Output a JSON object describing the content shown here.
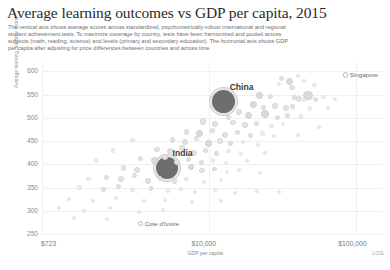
{
  "header": {
    "title": "Average learning outcomes vs GDP per capita, 2015",
    "subtitle_lines": [
      "The vertical axis shows average scores across standardized, psychometrically-robust international and regional",
      "student achievement tests. To maximize coverage by country, tests have been harmonized and pooled across",
      "subjects (math, reading, science) and levels (primary and secondary education). The horizontal axis shows GDP",
      "per capita after adjusting for price differences between countries and across time."
    ]
  },
  "chart_data": {
    "type": "scatter",
    "title": "Average learning outcomes vs GDP per capita, 2015",
    "xlabel": "GDP per capita",
    "ylabel": "Average learning outcome score",
    "xscale": "LOG",
    "xscale_note": "LOG",
    "xlim": [
      723,
      150000
    ],
    "ylim": [
      250,
      620
    ],
    "grid": true,
    "legend": "none",
    "yticks": [
      600,
      550,
      500,
      450,
      400,
      350,
      300,
      250
    ],
    "xticks": [
      "$723",
      "$10,000",
      "$100,000"
    ],
    "xtick_values": [
      723,
      10000,
      100000
    ],
    "annotations": [
      {
        "label": "China",
        "x": 12500,
        "y": 535,
        "size": "large"
      },
      {
        "label": "India",
        "x": 5100,
        "y": 392,
        "size": "large"
      },
      {
        "label": "Singapore",
        "x": 85000,
        "y": 592,
        "size": "small"
      },
      {
        "label": "Cote d'Ivoire",
        "x": 3400,
        "y": 272,
        "size": "small"
      }
    ],
    "points": [
      {
        "x": 12500,
        "y": 535,
        "r": 13.5,
        "cls": "big",
        "name": "China"
      },
      {
        "x": 5100,
        "y": 392,
        "r": 13.0,
        "cls": "big",
        "name": "India"
      },
      {
        "x": 85000,
        "y": 592,
        "r": 2.6,
        "cls": "ring",
        "name": "Singapore"
      },
      {
        "x": 3400,
        "y": 272,
        "r": 2.6,
        "cls": "ring",
        "name": "Cote d'Ivoire"
      },
      {
        "x": 31000,
        "y": 585,
        "r": 2.4,
        "cls": "pt"
      },
      {
        "x": 35000,
        "y": 578,
        "r": 3.6,
        "cls": "mid"
      },
      {
        "x": 40000,
        "y": 590,
        "r": 2.2,
        "cls": "tiny"
      },
      {
        "x": 44000,
        "y": 580,
        "r": 2.0,
        "cls": "tiny"
      },
      {
        "x": 36500,
        "y": 566,
        "r": 2.6,
        "cls": "pt"
      },
      {
        "x": 30000,
        "y": 572,
        "r": 2.0,
        "cls": "tiny"
      },
      {
        "x": 52000,
        "y": 570,
        "r": 2.1,
        "cls": "tiny"
      },
      {
        "x": 22000,
        "y": 548,
        "r": 3.2,
        "cls": "mid"
      },
      {
        "x": 26000,
        "y": 545,
        "r": 2.4,
        "cls": "pt"
      },
      {
        "x": 47000,
        "y": 548,
        "r": 4.6,
        "cls": "mid"
      },
      {
        "x": 53000,
        "y": 540,
        "r": 2.6,
        "cls": "pt"
      },
      {
        "x": 60000,
        "y": 545,
        "r": 2.2,
        "cls": "tiny"
      },
      {
        "x": 41000,
        "y": 540,
        "r": 3.0,
        "cls": "pt"
      },
      {
        "x": 38000,
        "y": 543,
        "r": 2.6,
        "cls": "pt"
      },
      {
        "x": 44000,
        "y": 538,
        "r": 2.2,
        "cls": "tiny"
      },
      {
        "x": 72000,
        "y": 540,
        "r": 2.0,
        "cls": "tiny"
      },
      {
        "x": 20000,
        "y": 528,
        "r": 3.4,
        "cls": "mid"
      },
      {
        "x": 23500,
        "y": 522,
        "r": 2.4,
        "cls": "pt"
      },
      {
        "x": 28000,
        "y": 525,
        "r": 2.8,
        "cls": "pt"
      },
      {
        "x": 33000,
        "y": 520,
        "r": 3.0,
        "cls": "pt"
      },
      {
        "x": 37000,
        "y": 524,
        "r": 2.4,
        "cls": "pt"
      },
      {
        "x": 48000,
        "y": 520,
        "r": 2.2,
        "cls": "tiny"
      },
      {
        "x": 64000,
        "y": 522,
        "r": 2.0,
        "cls": "tiny"
      },
      {
        "x": 16000,
        "y": 512,
        "r": 3.0,
        "cls": "pt"
      },
      {
        "x": 18500,
        "y": 505,
        "r": 3.4,
        "cls": "mid"
      },
      {
        "x": 24000,
        "y": 508,
        "r": 4.0,
        "cls": "mid"
      },
      {
        "x": 29000,
        "y": 500,
        "r": 2.6,
        "cls": "pt"
      },
      {
        "x": 34000,
        "y": 505,
        "r": 2.4,
        "cls": "pt"
      },
      {
        "x": 42000,
        "y": 503,
        "r": 2.2,
        "cls": "tiny"
      },
      {
        "x": 13500,
        "y": 500,
        "r": 2.4,
        "cls": "pt"
      },
      {
        "x": 9000,
        "y": 492,
        "r": 3.2,
        "cls": "pt"
      },
      {
        "x": 11000,
        "y": 487,
        "r": 3.0,
        "cls": "pt"
      },
      {
        "x": 14500,
        "y": 490,
        "r": 2.6,
        "cls": "pt"
      },
      {
        "x": 17500,
        "y": 484,
        "r": 2.8,
        "cls": "pt"
      },
      {
        "x": 21000,
        "y": 488,
        "r": 2.4,
        "cls": "pt"
      },
      {
        "x": 26500,
        "y": 482,
        "r": 2.2,
        "cls": "tiny"
      },
      {
        "x": 31500,
        "y": 486,
        "r": 2.0,
        "cls": "tiny"
      },
      {
        "x": 56000,
        "y": 480,
        "r": 2.0,
        "cls": "tiny"
      },
      {
        "x": 7000,
        "y": 470,
        "r": 2.8,
        "cls": "pt"
      },
      {
        "x": 8600,
        "y": 466,
        "r": 3.4,
        "cls": "mid"
      },
      {
        "x": 10500,
        "y": 472,
        "r": 2.6,
        "cls": "pt"
      },
      {
        "x": 12800,
        "y": 464,
        "r": 3.0,
        "cls": "pt"
      },
      {
        "x": 15500,
        "y": 468,
        "r": 2.4,
        "cls": "pt"
      },
      {
        "x": 19000,
        "y": 462,
        "r": 2.8,
        "cls": "pt"
      },
      {
        "x": 23000,
        "y": 466,
        "r": 2.2,
        "cls": "tiny"
      },
      {
        "x": 27500,
        "y": 460,
        "r": 2.0,
        "cls": "tiny"
      },
      {
        "x": 40000,
        "y": 463,
        "r": 2.0,
        "cls": "tiny"
      },
      {
        "x": 5600,
        "y": 452,
        "r": 2.6,
        "cls": "pt"
      },
      {
        "x": 6800,
        "y": 448,
        "r": 3.0,
        "cls": "pt"
      },
      {
        "x": 8200,
        "y": 455,
        "r": 2.4,
        "cls": "pt"
      },
      {
        "x": 9800,
        "y": 445,
        "r": 3.6,
        "cls": "mid"
      },
      {
        "x": 11800,
        "y": 450,
        "r": 2.8,
        "cls": "pt"
      },
      {
        "x": 14000,
        "y": 444,
        "r": 2.4,
        "cls": "pt"
      },
      {
        "x": 17000,
        "y": 448,
        "r": 2.2,
        "cls": "tiny"
      },
      {
        "x": 21500,
        "y": 442,
        "r": 2.0,
        "cls": "tiny"
      },
      {
        "x": 3000,
        "y": 452,
        "r": 2.2,
        "cls": "tiny"
      },
      {
        "x": 4400,
        "y": 432,
        "r": 2.8,
        "cls": "pt"
      },
      {
        "x": 5400,
        "y": 428,
        "r": 3.2,
        "cls": "pt"
      },
      {
        "x": 6500,
        "y": 435,
        "r": 2.6,
        "cls": "pt"
      },
      {
        "x": 7800,
        "y": 425,
        "r": 3.0,
        "cls": "pt"
      },
      {
        "x": 9400,
        "y": 430,
        "r": 2.4,
        "cls": "pt"
      },
      {
        "x": 11200,
        "y": 424,
        "r": 2.6,
        "cls": "pt"
      },
      {
        "x": 13500,
        "y": 428,
        "r": 2.2,
        "cls": "tiny"
      },
      {
        "x": 16500,
        "y": 422,
        "r": 2.0,
        "cls": "tiny"
      },
      {
        "x": 24000,
        "y": 425,
        "r": 2.0,
        "cls": "tiny"
      },
      {
        "x": 2200,
        "y": 430,
        "r": 2.2,
        "cls": "tiny"
      },
      {
        "x": 3400,
        "y": 412,
        "r": 2.6,
        "cls": "pt"
      },
      {
        "x": 4200,
        "y": 408,
        "r": 3.4,
        "cls": "mid"
      },
      {
        "x": 5000,
        "y": 415,
        "r": 2.8,
        "cls": "pt"
      },
      {
        "x": 6000,
        "y": 405,
        "r": 3.0,
        "cls": "pt"
      },
      {
        "x": 7200,
        "y": 410,
        "r": 2.6,
        "cls": "pt"
      },
      {
        "x": 8800,
        "y": 404,
        "r": 2.4,
        "cls": "pt"
      },
      {
        "x": 10600,
        "y": 408,
        "r": 2.2,
        "cls": "tiny"
      },
      {
        "x": 13000,
        "y": 402,
        "r": 2.0,
        "cls": "tiny"
      },
      {
        "x": 18000,
        "y": 406,
        "r": 2.0,
        "cls": "tiny"
      },
      {
        "x": 1700,
        "y": 408,
        "r": 2.2,
        "cls": "tiny"
      },
      {
        "x": 2600,
        "y": 392,
        "r": 2.6,
        "cls": "pt"
      },
      {
        "x": 3200,
        "y": 388,
        "r": 3.0,
        "cls": "pt"
      },
      {
        "x": 7500,
        "y": 394,
        "r": 3.2,
        "cls": "mid"
      },
      {
        "x": 8900,
        "y": 386,
        "r": 2.6,
        "cls": "pt"
      },
      {
        "x": 10800,
        "y": 390,
        "r": 2.4,
        "cls": "pt"
      },
      {
        "x": 13200,
        "y": 384,
        "r": 2.2,
        "cls": "tiny"
      },
      {
        "x": 16000,
        "y": 388,
        "r": 2.0,
        "cls": "tiny"
      },
      {
        "x": 22000,
        "y": 382,
        "r": 2.0,
        "cls": "tiny"
      },
      {
        "x": 2000,
        "y": 372,
        "r": 2.4,
        "cls": "pt"
      },
      {
        "x": 2500,
        "y": 368,
        "r": 2.8,
        "cls": "pt"
      },
      {
        "x": 3100,
        "y": 375,
        "r": 2.6,
        "cls": "pt"
      },
      {
        "x": 3800,
        "y": 365,
        "r": 3.0,
        "cls": "pt"
      },
      {
        "x": 4600,
        "y": 370,
        "r": 2.4,
        "cls": "pt"
      },
      {
        "x": 5800,
        "y": 364,
        "r": 2.6,
        "cls": "pt"
      },
      {
        "x": 7000,
        "y": 368,
        "r": 2.2,
        "cls": "tiny"
      },
      {
        "x": 9200,
        "y": 362,
        "r": 2.0,
        "cls": "tiny"
      },
      {
        "x": 12000,
        "y": 366,
        "r": 2.0,
        "cls": "tiny"
      },
      {
        "x": 1500,
        "y": 368,
        "r": 2.2,
        "cls": "tiny"
      },
      {
        "x": 1300,
        "y": 350,
        "r": 2.2,
        "cls": "tiny"
      },
      {
        "x": 1900,
        "y": 345,
        "r": 2.4,
        "cls": "pt"
      },
      {
        "x": 2400,
        "y": 352,
        "r": 2.6,
        "cls": "pt"
      },
      {
        "x": 3000,
        "y": 344,
        "r": 2.2,
        "cls": "tiny"
      },
      {
        "x": 4000,
        "y": 348,
        "r": 2.4,
        "cls": "pt"
      },
      {
        "x": 5200,
        "y": 342,
        "r": 2.2,
        "cls": "tiny"
      },
      {
        "x": 6400,
        "y": 346,
        "r": 2.0,
        "cls": "tiny"
      },
      {
        "x": 8000,
        "y": 340,
        "r": 2.0,
        "cls": "tiny"
      },
      {
        "x": 11000,
        "y": 344,
        "r": 2.0,
        "cls": "tiny"
      },
      {
        "x": 15000,
        "y": 338,
        "r": 2.0,
        "cls": "tiny"
      },
      {
        "x": 21000,
        "y": 342,
        "r": 2.0,
        "cls": "tiny"
      },
      {
        "x": 30000,
        "y": 340,
        "r": 2.0,
        "cls": "tiny"
      },
      {
        "x": 1100,
        "y": 325,
        "r": 2.2,
        "cls": "tiny"
      },
      {
        "x": 1600,
        "y": 322,
        "r": 2.0,
        "cls": "tiny"
      },
      {
        "x": 2300,
        "y": 328,
        "r": 2.2,
        "cls": "tiny"
      },
      {
        "x": 3600,
        "y": 320,
        "r": 2.0,
        "cls": "tiny"
      },
      {
        "x": 5000,
        "y": 324,
        "r": 2.0,
        "cls": "tiny"
      },
      {
        "x": 7600,
        "y": 318,
        "r": 2.0,
        "cls": "tiny"
      },
      {
        "x": 12000,
        "y": 322,
        "r": 2.0,
        "cls": "tiny"
      },
      {
        "x": 950,
        "y": 305,
        "r": 2.0,
        "cls": "tiny"
      },
      {
        "x": 1400,
        "y": 300,
        "r": 2.2,
        "cls": "tiny"
      },
      {
        "x": 2100,
        "y": 306,
        "r": 2.0,
        "cls": "tiny"
      },
      {
        "x": 3300,
        "y": 298,
        "r": 2.0,
        "cls": "tiny"
      },
      {
        "x": 4800,
        "y": 302,
        "r": 2.0,
        "cls": "tiny"
      },
      {
        "x": 1200,
        "y": 285,
        "r": 2.0,
        "cls": "tiny"
      },
      {
        "x": 2000,
        "y": 282,
        "r": 2.0,
        "cls": "tiny"
      }
    ]
  }
}
